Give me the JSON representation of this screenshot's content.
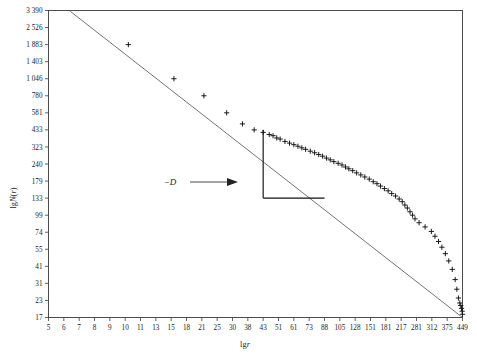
{
  "chart_data": {
    "type": "scatter",
    "title": "",
    "xlabel": "lgr",
    "ylabel": "lgN(r)",
    "grid": false,
    "legend": null,
    "axis_scale": "log-log",
    "x_tick_labels": [
      "5",
      "6",
      "7",
      "8",
      "9",
      "10",
      "11",
      "13",
      "15",
      "18",
      "21",
      "25",
      "30",
      "38",
      "43",
      "51",
      "61",
      "73",
      "88",
      "105",
      "128",
      "151",
      "181",
      "217",
      "281",
      "312",
      "375",
      "449"
    ],
    "y_tick_labels": [
      "3 390",
      "2 526",
      "1 883",
      "1 403",
      "1 046",
      "780",
      "581",
      "433",
      "323",
      "240",
      "179",
      "133",
      "99",
      "74",
      "55",
      "41",
      "31",
      "23",
      "17"
    ],
    "xlim_labels": [
      "5",
      "449"
    ],
    "ylim_labels": [
      "17",
      "3 390"
    ],
    "annotations": [
      {
        "text": "−D",
        "meaning": "negative-fractal-dimension-slope",
        "target": "slope-triangle-hypotenuse"
      }
    ],
    "fit_line": {
      "description": "straight regression line through log-log data",
      "x_start_label": "5",
      "y_start_label": "3 390",
      "x_end_label": "449",
      "y_end_label": "17"
    },
    "slope_triangle": {
      "description": "right triangle with hypotenuse on the fit line indicating slope -D",
      "x_left_label": "43",
      "x_right_label": "88",
      "y_top_label": "433",
      "y_bottom_label": "133"
    },
    "points": [
      [
        10.2,
        1883
      ],
      [
        15.5,
        1046
      ],
      [
        21.5,
        780
      ],
      [
        28,
        581
      ],
      [
        35,
        480
      ],
      [
        40,
        433
      ],
      [
        43,
        415
      ],
      [
        46,
        400
      ],
      [
        48,
        392
      ],
      [
        50,
        377
      ],
      [
        52,
        370
      ],
      [
        55,
        355
      ],
      [
        58,
        345
      ],
      [
        61,
        336
      ],
      [
        64,
        327
      ],
      [
        67,
        318
      ],
      [
        70,
        310
      ],
      [
        74,
        300
      ],
      [
        78,
        292
      ],
      [
        82,
        283
      ],
      [
        86,
        275
      ],
      [
        90,
        266
      ],
      [
        94,
        258
      ],
      [
        98,
        250
      ],
      [
        103,
        243
      ],
      [
        108,
        236
      ],
      [
        113,
        228
      ],
      [
        118,
        221
      ],
      [
        124,
        214
      ],
      [
        130,
        206
      ],
      [
        136,
        199
      ],
      [
        142,
        192
      ],
      [
        149,
        185
      ],
      [
        156,
        177
      ],
      [
        163,
        171
      ],
      [
        170,
        164
      ],
      [
        178,
        157
      ],
      [
        186,
        151
      ],
      [
        194,
        144
      ],
      [
        203,
        138
      ],
      [
        212,
        131
      ],
      [
        221,
        125
      ],
      [
        231,
        118
      ],
      [
        241,
        112
      ],
      [
        252,
        105
      ],
      [
        263,
        99
      ],
      [
        274,
        93
      ],
      [
        286,
        87
      ],
      [
        298,
        81
      ],
      [
        311,
        75
      ],
      [
        324,
        69
      ],
      [
        338,
        63
      ],
      [
        352,
        57
      ],
      [
        367,
        51
      ],
      [
        382,
        45
      ],
      [
        398,
        39
      ],
      [
        412,
        33
      ],
      [
        420,
        28
      ],
      [
        428,
        24
      ],
      [
        435,
        22
      ],
      [
        440,
        21
      ],
      [
        444,
        20
      ],
      [
        447,
        19
      ],
      [
        449,
        18
      ]
    ]
  }
}
